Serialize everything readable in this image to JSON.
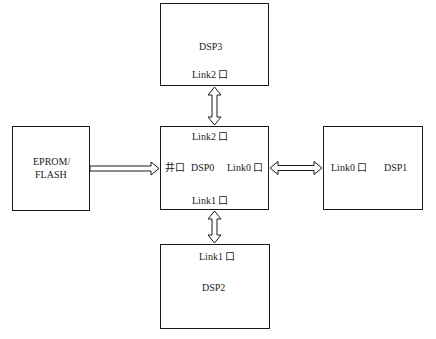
{
  "diagram": {
    "type": "block-diagram",
    "nodes": [
      {
        "id": "dsp3",
        "title": "DSP3",
        "ports": [
          "Link2 口"
        ]
      },
      {
        "id": "dsp0",
        "title": "DSP0",
        "ports": [
          "Link2 口",
          "井口",
          "Link0 口",
          "Link1 口"
        ]
      },
      {
        "id": "dsp2",
        "title": "DSP2",
        "ports": [
          "Link1 口"
        ]
      },
      {
        "id": "dsp1",
        "title": "DSP1",
        "ports": [
          "Link0 口"
        ]
      },
      {
        "id": "eprom",
        "title_line1": "EPROM/",
        "title_line2": "FLASH"
      }
    ],
    "edges": [
      {
        "from": "eprom",
        "to": "dsp0",
        "direction": "one-way",
        "port": "井口"
      },
      {
        "from": "dsp0",
        "to": "dsp3",
        "direction": "two-way",
        "ports": [
          "Link2 口",
          "Link2 口"
        ]
      },
      {
        "from": "dsp0",
        "to": "dsp1",
        "direction": "two-way",
        "ports": [
          "Link0 口",
          "Link0 口"
        ]
      },
      {
        "from": "dsp0",
        "to": "dsp2",
        "direction": "two-way",
        "ports": [
          "Link1 口",
          "Link1 口"
        ]
      }
    ]
  },
  "labels": {
    "dsp3_title": "DSP3",
    "dsp3_port": "Link2 口",
    "dsp0_title": "DSP0",
    "dsp0_top_port": "Link2 口",
    "dsp0_left_port": "井口",
    "dsp0_right_port": "Link0 口",
    "dsp0_bottom_port": "Link1 口",
    "dsp2_title": "DSP2",
    "dsp2_port": "Link1 口",
    "dsp1_title": "DSP1",
    "dsp1_port": "Link0 口",
    "eprom_line1": "EPROM/",
    "eprom_line2": "FLASH"
  }
}
